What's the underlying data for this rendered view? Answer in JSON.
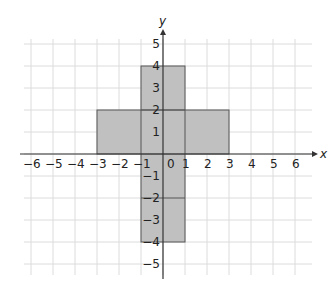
{
  "chart_data": {
    "type": "diagram",
    "title": "",
    "xlabel": "x",
    "ylabel": "y",
    "xlim": [
      -6,
      6
    ],
    "ylim": [
      -5,
      5
    ],
    "grid": true,
    "x_ticks": [
      "−6",
      "−5",
      "−4",
      "−3",
      "−2",
      "−1",
      "0",
      "1",
      "2",
      "3",
      "4",
      "5",
      "6"
    ],
    "y_ticks": [
      "5",
      "4",
      "3",
      "2",
      "1",
      "−1",
      "−2",
      "−3",
      "−4",
      "−5"
    ],
    "shapes": [
      {
        "name": "vertical-bar",
        "x": [
          -1,
          1
        ],
        "y": [
          -4,
          4
        ],
        "fill": "#c0c0c0"
      },
      {
        "name": "horizontal-bar",
        "x": [
          -3,
          3
        ],
        "y": [
          0,
          2
        ],
        "fill": "#c0c0c0"
      }
    ],
    "internal_lines": [
      {
        "from": [
          -1,
          2
        ],
        "to": [
          1,
          2
        ]
      },
      {
        "from": [
          -1,
          -2
        ],
        "to": [
          1,
          -2
        ]
      },
      {
        "from": [
          -1,
          0
        ],
        "to": [
          -1,
          2
        ]
      },
      {
        "from": [
          1,
          0
        ],
        "to": [
          1,
          2
        ]
      }
    ]
  },
  "axes": {
    "x_label": "x",
    "y_label": "y",
    "origin_label": "0"
  },
  "colors": {
    "grid": "#dcdcdc",
    "shape_fill": "#c0c0c0",
    "shape_stroke": "#555555",
    "axis": "#333333"
  }
}
